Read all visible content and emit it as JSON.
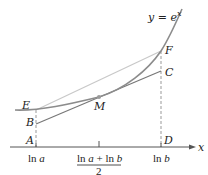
{
  "figure": {
    "curve_label": "y = e",
    "curve_label_exp": "x",
    "axis_label": "x",
    "points": {
      "E": "E",
      "B": "B",
      "A": "A",
      "M": "M",
      "F": "F",
      "C": "C",
      "D": "D"
    },
    "ticks": {
      "ln_a_prefix": "ln ",
      "ln_a_var": "a",
      "ln_b_prefix": "ln ",
      "ln_b_var": "b",
      "mid_numerator_1": "ln ",
      "mid_numerator_a": "a",
      "mid_numerator_plus": " + ln ",
      "mid_numerator_b": "b",
      "mid_denominator": "2"
    },
    "colors": {
      "curve": "#8c8c8c",
      "secant": "#c8c8c8",
      "tangent": "#777777",
      "axis": "#555555",
      "dashed": "#999999",
      "point_m": "#9a9a9a"
    }
  }
}
